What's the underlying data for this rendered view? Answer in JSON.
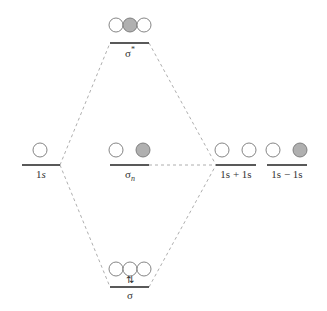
{
  "diagram": {
    "colors": {
      "line": "#222222",
      "dash": "#999999",
      "circle_stroke": "#777777",
      "filled": "#b0b0b0",
      "empty": "#ffffff"
    },
    "levels": [
      {
        "id": "sigma-star",
        "label": "σ",
        "sup": "*",
        "orbitals": [
          "empty",
          "filled",
          "empty"
        ]
      },
      {
        "id": "one-s",
        "label": "1",
        "label_italic": "s",
        "orbitals": [
          "empty"
        ]
      },
      {
        "id": "sigma-n",
        "label": "σ",
        "sub": "n",
        "orbitals": [
          "empty",
          "filled"
        ]
      },
      {
        "id": "one-s-plus-one-s",
        "label": "1s + 1s",
        "orbitals": [
          "empty",
          "empty"
        ]
      },
      {
        "id": "one-s-minus-one-s",
        "label": "1s − 1s",
        "orbitals": [
          "empty",
          "filled"
        ]
      },
      {
        "id": "sigma",
        "label": "σ",
        "electrons": "⇅",
        "orbitals": [
          "empty",
          "empty",
          "empty"
        ]
      }
    ]
  }
}
